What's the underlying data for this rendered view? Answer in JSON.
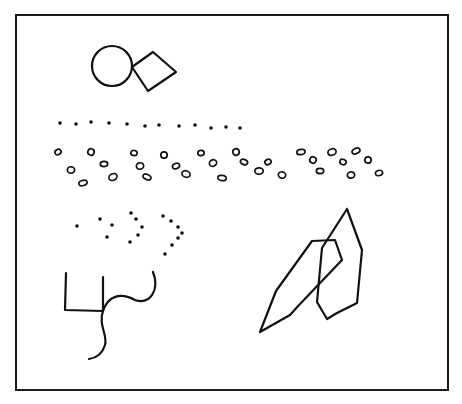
{
  "figure": {
    "background": "#ffffff",
    "ink": "#111111",
    "frame": {
      "x": 16,
      "y": 15,
      "width": 432,
      "height": 375
    },
    "circle": {
      "cx": 112,
      "cy": 66,
      "r": 20
    },
    "diamond": {
      "points": "132,67 153,52 176,72 148,91"
    },
    "dot_row": [
      [
        60,
        123
      ],
      [
        76,
        124
      ],
      [
        91,
        122
      ],
      [
        109,
        123
      ],
      [
        127,
        124
      ],
      [
        145,
        126
      ],
      [
        159,
        125
      ],
      [
        179,
        126
      ],
      [
        195,
        125
      ],
      [
        211,
        128
      ],
      [
        226,
        127
      ],
      [
        240,
        128
      ]
    ],
    "ring_rows": [
      [
        58,
        152
      ],
      [
        71,
        170
      ],
      [
        83,
        183
      ],
      [
        91,
        152
      ],
      [
        104,
        164
      ],
      [
        113,
        177
      ],
      [
        134,
        153
      ],
      [
        140,
        166
      ],
      [
        147,
        177
      ],
      [
        164,
        155
      ],
      [
        176,
        166
      ],
      [
        186,
        174
      ],
      [
        201,
        153
      ],
      [
        213,
        163
      ],
      [
        222,
        178
      ],
      [
        236,
        152
      ],
      [
        244,
        162
      ],
      [
        259,
        171
      ],
      [
        268,
        162
      ],
      [
        282,
        175
      ],
      [
        301,
        152
      ],
      [
        313,
        160
      ],
      [
        320,
        171
      ],
      [
        332,
        152
      ],
      [
        343,
        162
      ],
      [
        351,
        175
      ],
      [
        356,
        151
      ],
      [
        368,
        160
      ],
      [
        379,
        173
      ]
    ],
    "dot_arrow": [
      [
        77,
        226
      ],
      [
        100,
        219
      ],
      [
        112,
        225
      ],
      [
        107,
        237
      ],
      [
        131,
        213
      ],
      [
        136,
        219
      ],
      [
        142,
        227
      ],
      [
        138,
        235
      ],
      [
        130,
        242
      ],
      [
        163,
        216
      ],
      [
        171,
        221
      ],
      [
        178,
        227
      ],
      [
        182,
        233
      ],
      [
        178,
        238
      ],
      [
        172,
        245
      ],
      [
        165,
        254
      ]
    ],
    "wavy_figure": {
      "square_path": "M66,273 L65,310 L103,311 M103,277 L103,311",
      "curve_path": "M153,272 C160,290 150,305 135,300 C120,292 108,296 103,311 C98,325 108,335 105,345 C102,355 96,358 89,359"
    },
    "overlap_figure": {
      "polygon_a": "M260,332 L276,291 L312,241 L335,240 L342,260 L300,304 L290,315 Z",
      "polygon_b": "M347,209 L362,250 L357,303 L337,313 L327,319 L317,302 L322,248 L347,209"
    }
  }
}
